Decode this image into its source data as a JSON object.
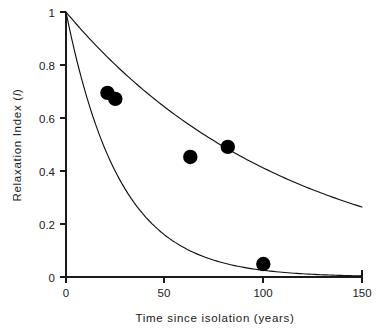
{
  "chart_data": {
    "type": "line",
    "title": "",
    "xlabel": "Time since isolation (years)",
    "ylabel": "Relaxation Index (I)",
    "ylabel_plain": "Relaxation  Index (",
    "ylabel_italic": "I",
    "ylabel_close": ")",
    "xlim": [
      0,
      150
    ],
    "ylim": [
      0,
      1
    ],
    "xticks": [
      0,
      50,
      100,
      150
    ],
    "xtick_labels": [
      "0",
      "50",
      "100",
      "150"
    ],
    "yticks": [
      0,
      0.2,
      0.4,
      0.6,
      0.8,
      1
    ],
    "ytick_labels": [
      "0",
      "0.2",
      "0.4",
      "0.6",
      "0.8",
      "1"
    ],
    "grid": false,
    "legend": "none",
    "series": [
      {
        "name": "upper-decay-curve",
        "type": "line",
        "model": "exponential-decay",
        "decay_rate": 0.00888,
        "x": [
          0,
          10,
          20,
          30,
          40,
          50,
          60,
          70,
          80,
          90,
          100,
          110,
          120,
          130,
          140,
          150
        ],
        "values": [
          1.0,
          0.915,
          0.837,
          0.766,
          0.701,
          0.641,
          0.587,
          0.537,
          0.491,
          0.449,
          0.411,
          0.376,
          0.344,
          0.315,
          0.288,
          0.264
        ]
      },
      {
        "name": "lower-decay-curve",
        "type": "line",
        "model": "exponential-decay",
        "decay_rate": 0.0368,
        "x": [
          0,
          10,
          20,
          30,
          40,
          50,
          60,
          70,
          80,
          90,
          100,
          110,
          120,
          130,
          140,
          150
        ],
        "values": [
          1.0,
          0.692,
          0.479,
          0.331,
          0.229,
          0.159,
          0.11,
          0.076,
          0.053,
          0.036,
          0.025,
          0.017,
          0.012,
          0.008,
          0.006,
          0.004
        ]
      },
      {
        "name": "observed-points",
        "type": "scatter",
        "points": [
          {
            "x": 21,
            "y": 0.695
          },
          {
            "x": 25,
            "y": 0.672
          },
          {
            "x": 63,
            "y": 0.453
          },
          {
            "x": 82,
            "y": 0.491
          },
          {
            "x": 100,
            "y": 0.049
          }
        ]
      }
    ],
    "colors": {
      "axis": "#1a1a1a",
      "curve": "#111111",
      "marker": "#000000",
      "background": "#ffffff"
    }
  }
}
